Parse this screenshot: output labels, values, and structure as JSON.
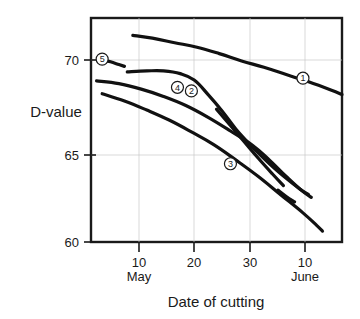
{
  "chart_data": {
    "type": "line",
    "title": "",
    "xlabel": "Date of cutting",
    "ylabel": "D-value",
    "xlim": [
      1,
      46
    ],
    "ylim": [
      60,
      71.8
    ],
    "grid": true,
    "legend_position": "inline-markers",
    "x_tick_labels": [
      "10",
      "20",
      "30",
      "10"
    ],
    "x_tick_months": [
      "May",
      "",
      "",
      "June"
    ],
    "x_tick_values": [
      10,
      20,
      30,
      41
    ],
    "y_tick_labels": [
      "70",
      "65",
      "60"
    ],
    "y_tick_values": [
      70,
      65,
      60
    ],
    "series": [
      {
        "name": "1",
        "marker_label": "1",
        "marker_x": 39.0,
        "marker_y": 69.0,
        "points": [
          [
            8.5,
            71.35
          ],
          [
            12,
            71.2
          ],
          [
            16,
            70.95
          ],
          [
            20,
            70.7
          ],
          [
            24,
            70.35
          ],
          [
            28,
            69.95
          ],
          [
            32,
            69.6
          ],
          [
            36,
            69.2
          ],
          [
            40,
            68.8
          ],
          [
            44,
            68.35
          ],
          [
            46,
            68.1
          ]
        ]
      },
      {
        "name": "2",
        "marker_label": "2",
        "marker_x": 19.0,
        "marker_y": 68.3,
        "points": [
          [
            7.5,
            69.35
          ],
          [
            11,
            69.4
          ],
          [
            14,
            69.4
          ],
          [
            17,
            69.25
          ],
          [
            19.5,
            68.9
          ],
          [
            22,
            68.1
          ],
          [
            24.5,
            67.2
          ],
          [
            27,
            66.2
          ],
          [
            30,
            65.2
          ],
          [
            33,
            64.3
          ],
          [
            36,
            63.5
          ],
          [
            38.5,
            62.9
          ],
          [
            40,
            62.6
          ]
        ]
      },
      {
        "name": "3",
        "marker_label": "3",
        "marker_x": 26.0,
        "marker_y": 64.3,
        "points": [
          [
            3.0,
            68.15
          ],
          [
            7,
            67.75
          ],
          [
            11,
            67.25
          ],
          [
            15,
            66.7
          ],
          [
            19,
            66.05
          ],
          [
            23,
            65.35
          ],
          [
            27,
            64.5
          ],
          [
            31,
            63.6
          ],
          [
            35,
            62.6
          ],
          [
            39,
            61.6
          ],
          [
            41.5,
            60.9
          ],
          [
            42.5,
            60.6
          ]
        ]
      },
      {
        "name": "4",
        "marker_label": "4",
        "marker_x": 16.5,
        "marker_y": 68.5,
        "points": [
          [
            2.0,
            68.85
          ],
          [
            6,
            68.7
          ],
          [
            10,
            68.4
          ],
          [
            14,
            68.0
          ],
          [
            18,
            67.5
          ],
          [
            22,
            66.85
          ],
          [
            26,
            66.1
          ],
          [
            30,
            65.3
          ],
          [
            33,
            64.5
          ],
          [
            36,
            63.6
          ],
          [
            38.5,
            62.9
          ],
          [
            40.5,
            62.45
          ]
        ]
      },
      {
        "name": "5",
        "marker_label": "5",
        "marker_x": 3.0,
        "marker_y": 70.05,
        "points": [
          [
            3.2,
            70.0
          ],
          [
            4.5,
            69.9
          ],
          [
            6,
            69.75
          ],
          [
            7,
            69.65
          ]
        ]
      }
    ],
    "extra_segments": [
      {
        "name": "2-branch-lower",
        "points": [
          [
            23.5,
            67.3
          ],
          [
            26,
            66.4
          ],
          [
            28.5,
            65.5
          ],
          [
            31,
            64.6
          ],
          [
            33.5,
            63.75
          ],
          [
            35.5,
            63.1
          ]
        ]
      },
      {
        "name": "4-branch-lower",
        "points": [
          [
            34.5,
            62.85
          ],
          [
            36,
            62.5
          ],
          [
            37.5,
            62.2
          ]
        ]
      }
    ]
  },
  "axes": {
    "y_axis_title": "D-value",
    "x_axis_title": "Date of cutting"
  }
}
